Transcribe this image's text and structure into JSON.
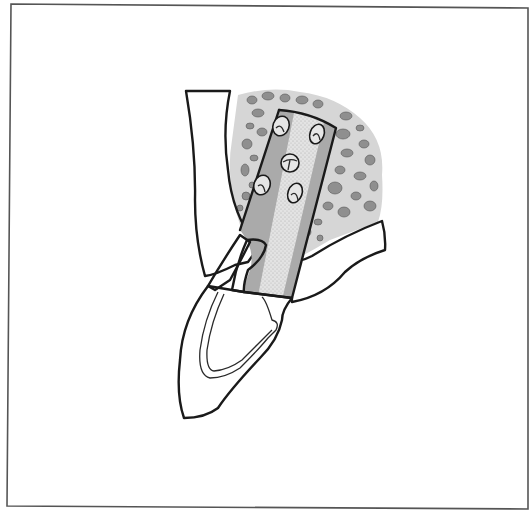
{
  "figure": {
    "colors": {
      "background": "#ffffff",
      "frame": "#555555",
      "gum_tissue": "#c9c9c9",
      "bone_matrix": "#d9d9d9",
      "bone_particles": "#8f8f8f",
      "implant_dark": "#a8a8a8",
      "implant_light": "#dcdcdc",
      "outline": "#1a1a1a"
    },
    "implant_holes": 5
  }
}
